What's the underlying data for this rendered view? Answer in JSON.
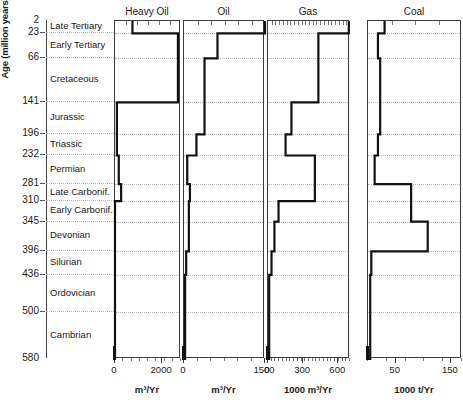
{
  "axis": {
    "y_title": "Age (million years)",
    "y_ticks": [
      2,
      23,
      66,
      141,
      196,
      232,
      281,
      310,
      345,
      396,
      436,
      500,
      580
    ],
    "y_min": 2,
    "y_max": 580
  },
  "periods": [
    {
      "name": "Late Tertiary",
      "top": 2,
      "bottom": 23
    },
    {
      "name": "Early Tertiary",
      "top": 23,
      "bottom": 66
    },
    {
      "name": "Cretaceous",
      "top": 66,
      "bottom": 141
    },
    {
      "name": "Jurassic",
      "top": 141,
      "bottom": 196
    },
    {
      "name": "Triassic",
      "top": 196,
      "bottom": 232
    },
    {
      "name": "Permian",
      "top": 232,
      "bottom": 281
    },
    {
      "name": "Late Carbonif.",
      "top": 281,
      "bottom": 310
    },
    {
      "name": "Early Carbonif.",
      "top": 310,
      "bottom": 345
    },
    {
      "name": "Devonian",
      "top": 345,
      "bottom": 396
    },
    {
      "name": "Silurian",
      "top": 396,
      "bottom": 436
    },
    {
      "name": "Ordovician",
      "top": 436,
      "bottom": 500
    },
    {
      "name": "Cambrian",
      "top": 500,
      "bottom": 580
    }
  ],
  "chart_data": [
    {
      "type": "line",
      "title": "Heavy Oil",
      "xlabel": "m³/Yr",
      "ylabel": "Age (million years)",
      "xlim": [
        0,
        2800
      ],
      "ylim": [
        580,
        2
      ],
      "xticks": [
        0,
        2000
      ],
      "xticklabels": [
        "0",
        "2000"
      ],
      "grid": true,
      "orientation": "horizontal-step",
      "categories": [
        "Late Tertiary",
        "Early Tertiary",
        "Cretaceous",
        "Jurassic",
        "Triassic",
        "Permian",
        "Late Carbonif.",
        "Early Carbonif.",
        "Devonian",
        "Silurian",
        "Ordovician",
        "Cambrian"
      ],
      "values": [
        740,
        2670,
        2670,
        80,
        80,
        160,
        260,
        0,
        0,
        0,
        0,
        0
      ]
    },
    {
      "type": "line",
      "title": "Oil",
      "xlabel": "m³/Yr",
      "ylabel": "Age (million years)",
      "xlim": [
        0,
        1500
      ],
      "ylim": [
        580,
        2
      ],
      "xticks": [
        0,
        1500
      ],
      "xticklabels": [
        "0",
        "1500"
      ],
      "grid": true,
      "orientation": "horizontal-step",
      "categories": [
        "Late Tertiary",
        "Early Tertiary",
        "Cretaceous",
        "Jurassic",
        "Triassic",
        "Permian",
        "Late Carbonif.",
        "Early Carbonif.",
        "Devonian",
        "Silurian",
        "Ordovician",
        "Cambrian"
      ],
      "values": [
        1500,
        620,
        380,
        380,
        230,
        60,
        110,
        90,
        90,
        40,
        20,
        20
      ]
    },
    {
      "type": "line",
      "title": "Gas",
      "xlabel": "1000 m³/Yr",
      "ylabel": "Age (million years)",
      "xlim": [
        0,
        700
      ],
      "ylim": [
        580,
        2
      ],
      "xticks": [
        0,
        300,
        600
      ],
      "xticklabels": [
        "0",
        "300",
        "600"
      ],
      "grid": true,
      "orientation": "horizontal-step",
      "categories": [
        "Late Tertiary",
        "Early Tertiary",
        "Cretaceous",
        "Jurassic",
        "Triassic",
        "Permian",
        "Late Carbonif.",
        "Early Carbonif.",
        "Devonian",
        "Silurian",
        "Ordovician",
        "Cambrian"
      ],
      "values": [
        690,
        430,
        430,
        200,
        150,
        400,
        400,
        90,
        55,
        30,
        10,
        10
      ]
    },
    {
      "type": "line",
      "title": "Coal",
      "xlabel": "1000 t/Yr",
      "ylabel": "Age (million years)",
      "xlim": [
        0,
        170
      ],
      "ylim": [
        580,
        2
      ],
      "xticks": [
        50,
        150
      ],
      "xticklabels": [
        "50",
        "150"
      ],
      "grid": true,
      "orientation": "horizontal-step",
      "categories": [
        "Late Tertiary",
        "Early Tertiary",
        "Cretaceous",
        "Jurassic",
        "Triassic",
        "Permian",
        "Late Carbonif.",
        "Early Carbonif.",
        "Devonian",
        "Silurian",
        "Ordovician",
        "Cambrian"
      ],
      "values": [
        30,
        18,
        22,
        22,
        18,
        12,
        78,
        78,
        108,
        6,
        4,
        4
      ]
    }
  ]
}
